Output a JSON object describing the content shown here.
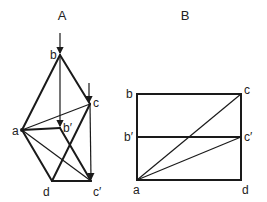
{
  "figures": [
    {
      "id": "A",
      "title": "A",
      "labels": {
        "a": "a",
        "b": "b",
        "b_prime": "b′",
        "c": "c",
        "c_prime": "c′",
        "d": "d"
      }
    },
    {
      "id": "B",
      "title": "B",
      "labels": {
        "a": "a",
        "b": "b",
        "b_prime": "b′",
        "c": "c",
        "c_prime": "c′",
        "d": "d"
      }
    }
  ]
}
